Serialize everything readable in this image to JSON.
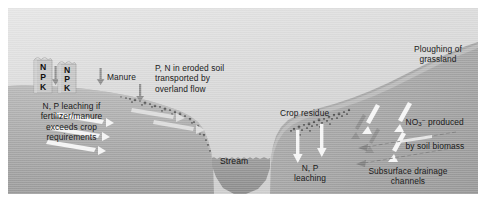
{
  "figure": {
    "type": "cross-section-diagram",
    "background_color": "#ffffff",
    "scene_bounds": {
      "x": 8,
      "y": 8,
      "width": 470,
      "height": 186
    }
  },
  "colors": {
    "sky_top": "#e6e6e6",
    "sky_bottom": "#cacaca",
    "soil_surface": "#b4b4b4",
    "soil_body": "#a8a8a8",
    "soil_deep": "#9c9c9c",
    "stream_water": "#8e8e8e",
    "bag_fill": "#c4c4c4",
    "arrow_light": "#f2f2f2",
    "arrow_dark": "#8a8a8a",
    "residue": "#5a5a5a",
    "text": "#1a1a1a"
  },
  "labels": {
    "fertilizer_bags": [
      {
        "id": "bag-1",
        "lines": [
          "N",
          "P",
          "K"
        ]
      },
      {
        "id": "bag-2",
        "lines": [
          "N",
          "P",
          "K"
        ]
      }
    ],
    "manure": "Manure",
    "leaching_left": "N, P leaching if\nfertilizer/manure\nexceeds crop\nrequirements",
    "eroded_soil": "P, N in eroded soil\ntransported by\noverland flow",
    "stream": "Stream",
    "crop_residue": "Crop residue",
    "leaching_right": "N, P\nleaching",
    "ploughing": "Ploughing of\ngrassland",
    "nitrate_produced_line1_prefix": "NO",
    "nitrate_produced_line1_sub": "3",
    "nitrate_produced_line1_sup": "−",
    "nitrate_produced_line1_suffix": " produced",
    "nitrate_produced_line2": "by soil biomass",
    "subsurface_drainage": "Subsurface drainage\nchannels"
  },
  "arrows": {
    "manure_application": {
      "count": 3,
      "direction": "down",
      "color": "#8a8a8a"
    },
    "leaching_left": {
      "count": 3,
      "direction": "down-right",
      "color": "#f2f2f2"
    },
    "overland_flow": {
      "count": 2,
      "direction": "right-down",
      "color": "#cfcfcf"
    },
    "leaching_right": {
      "count": 2,
      "direction": "down",
      "color": "#f2f2f2"
    },
    "nitrate_movement": {
      "count": 3,
      "direction": "down-left",
      "color": "#f2f2f2"
    },
    "drainage_channels": {
      "count": 2,
      "direction": "left",
      "color": "#8a8a8a"
    }
  },
  "features": {
    "eroded_soil_stipple": "dotted texture along left valley slope",
    "crop_residue_stipple": "dotted texture on right slope above leaching arrows",
    "stream_channel": "V-shaped valley with water at base"
  }
}
